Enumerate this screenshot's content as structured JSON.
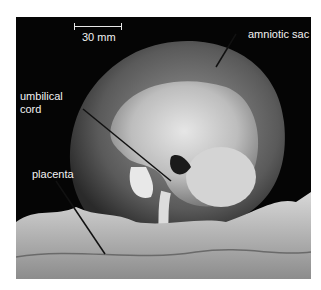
{
  "figure": {
    "scale_bar": {
      "label": "30 mm"
    },
    "labels": {
      "amniotic_sac": "amniotic sac",
      "umbilical_cord_line1": "umbilical",
      "umbilical_cord_line2": "cord",
      "placenta": "placenta"
    },
    "colors": {
      "background": "#050505",
      "label_text": "#f2f2f2",
      "page": "#ffffff"
    }
  }
}
